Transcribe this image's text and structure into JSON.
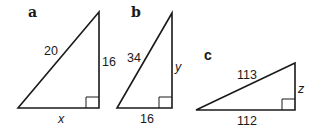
{
  "triangles": [
    {
      "id": "a",
      "label": "a",
      "hypotenuse": "20",
      "vertical_leg": "16",
      "horizontal_leg": "x",
      "right_angle": "bottom-right"
    },
    {
      "id": "b",
      "label": "b",
      "hypotenuse": "34",
      "vertical_leg": "y",
      "horizontal_leg": "16",
      "right_angle": "bottom-right"
    },
    {
      "id": "c",
      "label": "c",
      "hypotenuse": "113",
      "vertical_leg": "z",
      "horizontal_leg": "112",
      "right_angle": "bottom-right"
    }
  ],
  "colors": {
    "stroke": "#1a1a1a",
    "background": "#ffffff"
  }
}
